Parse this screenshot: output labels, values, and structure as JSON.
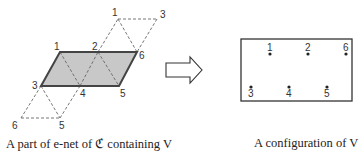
{
  "left_diagram": {
    "caption": "A part of e-net of ℭ containing V",
    "labels": {
      "top_1": "1",
      "top_3": "3",
      "p1": "1",
      "p2": "2",
      "p6": "6",
      "p3": "3",
      "p4": "4",
      "p5": "5",
      "bot_6": "6",
      "bot_5": "5"
    },
    "fill_color": "#c8c8c8",
    "edge_color": "#444444"
  },
  "arrow": {
    "direction": "right"
  },
  "right_diagram": {
    "caption": "A configuration of V",
    "points": [
      {
        "label": "1",
        "x": 270,
        "y": 54,
        "label_pos": "above"
      },
      {
        "label": "2",
        "x": 308,
        "y": 54,
        "label_pos": "above"
      },
      {
        "label": "6",
        "x": 346,
        "y": 54,
        "label_pos": "above"
      },
      {
        "label": "3",
        "x": 251,
        "y": 87,
        "label_pos": "below"
      },
      {
        "label": "4",
        "x": 289,
        "y": 87,
        "label_pos": "below"
      },
      {
        "label": "5",
        "x": 327,
        "y": 87,
        "label_pos": "below"
      }
    ]
  }
}
